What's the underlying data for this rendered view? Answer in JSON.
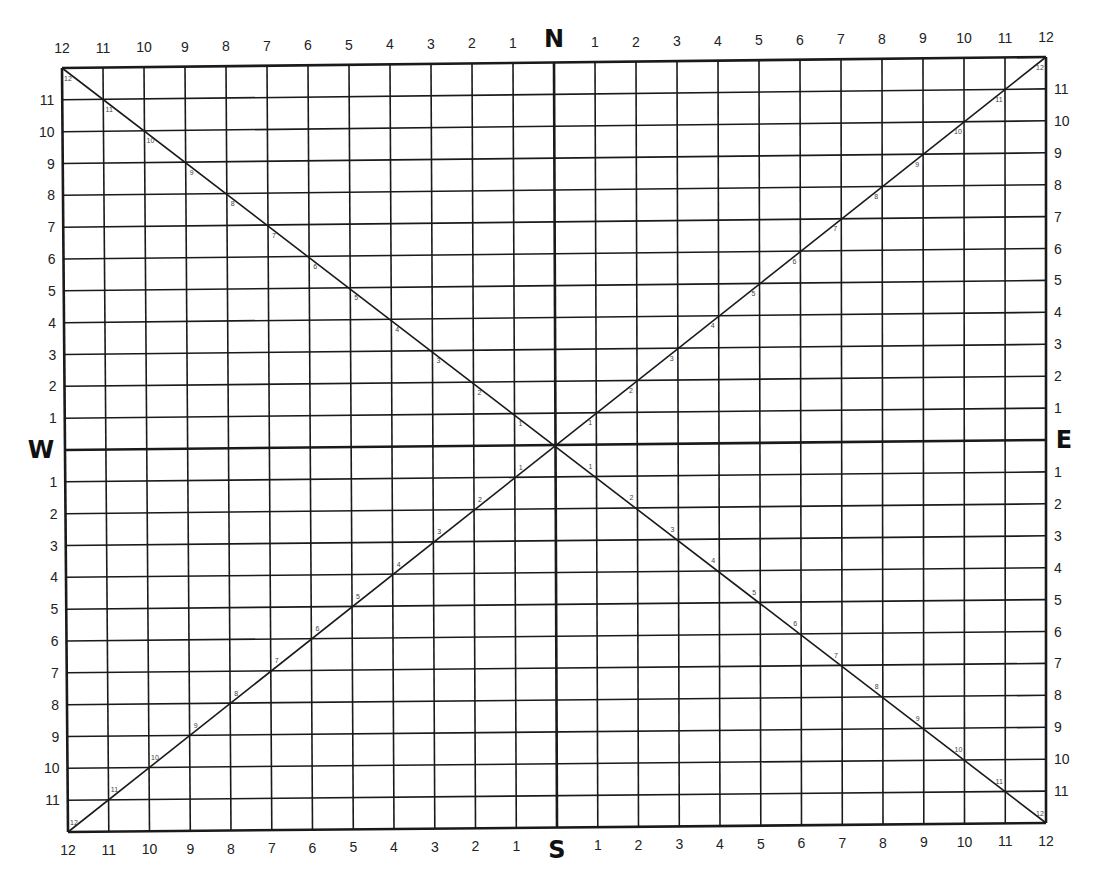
{
  "diagram": {
    "type": "compass-grid",
    "divisions_per_half": 12,
    "cardinals": {
      "north": "N",
      "south": "S",
      "east": "E",
      "west": "W"
    },
    "top_labels": [
      "12",
      "11",
      "10",
      "9",
      "8",
      "7",
      "6",
      "5",
      "4",
      "3",
      "2",
      "1",
      "N",
      "1",
      "2",
      "3",
      "4",
      "5",
      "6",
      "7",
      "8",
      "9",
      "10",
      "11",
      "12"
    ],
    "bottom_labels": [
      "12",
      "11",
      "10",
      "9",
      "8",
      "7",
      "6",
      "5",
      "4",
      "3",
      "2",
      "1",
      "S",
      "1",
      "2",
      "3",
      "4",
      "5",
      "6",
      "7",
      "8",
      "9",
      "10",
      "11",
      "12"
    ],
    "left_labels": [
      "11",
      "10",
      "9",
      "8",
      "7",
      "6",
      "5",
      "4",
      "3",
      "2",
      "1",
      "W",
      "1",
      "2",
      "3",
      "4",
      "5",
      "6",
      "7",
      "8",
      "9",
      "10",
      "11"
    ],
    "right_labels": [
      "11",
      "10",
      "9",
      "8",
      "7",
      "6",
      "5",
      "4",
      "3",
      "2",
      "1",
      "E",
      "1",
      "2",
      "3",
      "4",
      "5",
      "6",
      "7",
      "8",
      "9",
      "10",
      "11"
    ],
    "diagonal_labels": [
      "1",
      "2",
      "3",
      "4",
      "5",
      "6",
      "7",
      "8",
      "9",
      "10",
      "11",
      "12"
    ],
    "corners": {
      "tl": [
        62,
        68
      ],
      "tr": [
        1046,
        57
      ],
      "bl": [
        68,
        832
      ],
      "br": [
        1046,
        823
      ]
    },
    "colors": {
      "line": "#1a1a1a",
      "background": "#ffffff"
    }
  }
}
